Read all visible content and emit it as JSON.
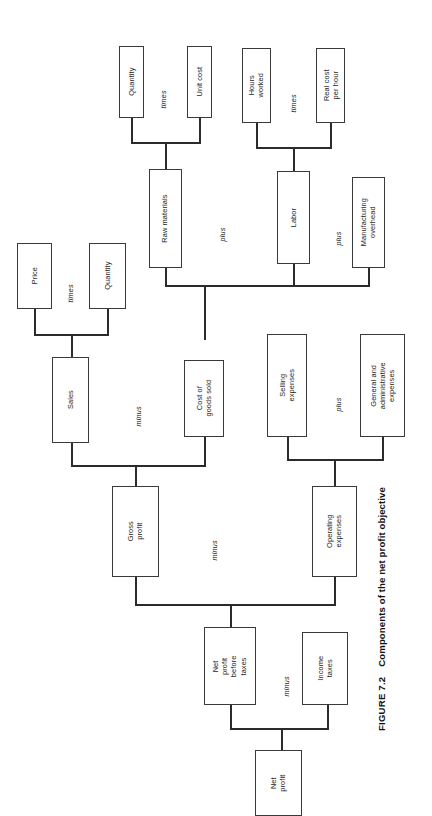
{
  "figure": {
    "number": "FIGURE 7.2",
    "caption": "Components of the net profit objective",
    "orientation": "rotated-90-counterclockwise",
    "ink_color": "#2b2b2b",
    "background_color": "#ffffff"
  },
  "nodes": {
    "quantity_materials": "Quantity",
    "unit_cost": "Unit cost",
    "hours_worked": "Hours\nworked",
    "real_cost_per_hour": "Real cost\nper hour",
    "raw_materials": "Raw materials",
    "labor": "Labor",
    "manufacturing_overhead": "Manufacturing\noverhead",
    "price": "Price",
    "quantity_sales": "Quantity",
    "sales": "Sales",
    "cost_of_goods_sold": "Cost of\ngoods sold",
    "selling_expenses": "Selling\nexpenses",
    "general_admin_expenses": "General and\nadministrative\nexpenses",
    "gross_profit": "Gross\nprofit",
    "operating_expenses": "Operating\nexpenses",
    "net_profit_before_taxes": "Net\nprofit\nbefore\ntaxes",
    "income_taxes": "Income\ntaxes",
    "net_profit": "Net\nprofit"
  },
  "operators": {
    "materials_times": "times",
    "labor_times": "times",
    "materials_plus_labor": "plus",
    "labor_plus_overhead": "plus",
    "sales_times": "times",
    "sales_minus_cogs": "minus",
    "selling_plus_admin": "plus",
    "gross_minus_operating": "minus",
    "npbt_minus_taxes": "minus"
  }
}
